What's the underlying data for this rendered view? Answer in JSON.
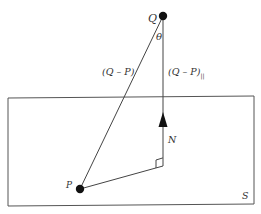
{
  "diagram": {
    "points": {
      "Q": {
        "label": "Q",
        "x": 163,
        "y": 16
      },
      "P": {
        "label": "P",
        "x": 80,
        "y": 189
      }
    },
    "plane_label": "S",
    "normal_label": "N",
    "angle_label": "θ",
    "vector_label": "(Q – P)",
    "parallel_label_main": "(Q – P)",
    "parallel_label_sub": "||",
    "colors": {
      "line": "#444444",
      "dot": "#111111",
      "background": "#ffffff"
    }
  }
}
